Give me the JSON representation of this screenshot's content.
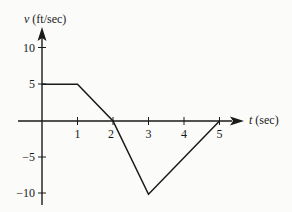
{
  "chart_data": {
    "type": "line",
    "title": "",
    "xlabel": "t (sec)",
    "ylabel": "v (ft/sec)",
    "x_axis_var": "t",
    "x_axis_unit": "(sec)",
    "y_axis_var": "v",
    "y_axis_unit": "(ft/sec)",
    "x_ticks": [
      1,
      2,
      3,
      4,
      5
    ],
    "y_ticks": [
      10,
      5,
      -5,
      -10
    ],
    "xlim": [
      0,
      5.6
    ],
    "ylim": [
      -10,
      12
    ],
    "grid": false,
    "legend": null,
    "series": [
      {
        "name": "v(t)",
        "x": [
          0,
          1,
          2,
          3,
          5
        ],
        "y": [
          5,
          5,
          0,
          -10,
          0
        ]
      }
    ]
  },
  "labels": {
    "x_tick_labels": [
      "1",
      "2",
      "3",
      "4",
      "5"
    ],
    "y_tick_labels": [
      "10",
      "5",
      "−5",
      "−10"
    ],
    "x_axis_var": "t",
    "x_axis_unit": " (sec)",
    "y_axis_var": "v",
    "y_axis_unit": " (ft/sec)"
  },
  "colors": {
    "ink": "#1a1a1a",
    "background": "#fbfbfa"
  }
}
